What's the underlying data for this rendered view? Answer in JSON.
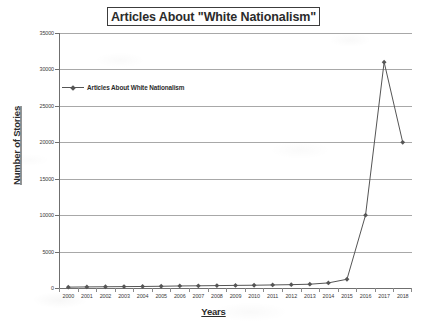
{
  "chart_data": {
    "type": "line",
    "title": "Articles About \"White Nationalism\"",
    "xlabel": "Years",
    "ylabel": "Number of Stories",
    "grid": true,
    "legend_position": "inside-top-left",
    "categories": [
      "2000",
      "2001",
      "2002",
      "2003",
      "2004",
      "2005",
      "2006",
      "2007",
      "2008",
      "2009",
      "2010",
      "2011",
      "2012",
      "2013",
      "2014",
      "2015",
      "2016",
      "2017",
      "2018"
    ],
    "ylim": [
      0,
      35000
    ],
    "ytick_labels": [
      "0",
      "5000",
      "10000",
      "15000",
      "20000",
      "25000",
      "30000",
      "35000"
    ],
    "ytick_values": [
      0,
      5000,
      10000,
      15000,
      20000,
      25000,
      30000,
      35000
    ],
    "series": [
      {
        "name": "Articles About White Nationalism",
        "color": "#555555",
        "marker": "diamond",
        "values": [
          120,
          150,
          170,
          190,
          210,
          240,
          280,
          300,
          330,
          360,
          380,
          420,
          460,
          520,
          700,
          1200,
          10000,
          31000,
          20000
        ]
      }
    ]
  },
  "legend": {
    "entry_label": "Articles About White Nationalism"
  }
}
